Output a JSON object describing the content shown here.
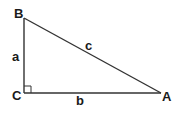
{
  "diagram": {
    "type": "right-triangle",
    "vertices": [
      {
        "id": "B",
        "label": "B",
        "x": 24,
        "y": 18
      },
      {
        "id": "C",
        "label": "C",
        "x": 24,
        "y": 93
      },
      {
        "id": "A",
        "label": "A",
        "x": 161,
        "y": 93
      }
    ],
    "sides": [
      {
        "id": "a",
        "label": "a",
        "from": "C",
        "to": "B"
      },
      {
        "id": "b",
        "label": "b",
        "from": "C",
        "to": "A"
      },
      {
        "id": "c",
        "label": "c",
        "from": "B",
        "to": "A"
      }
    ],
    "right_angle_at": "C",
    "colors": {
      "line": "#333333",
      "text": "#1a1a1a",
      "background": "#ffffff"
    }
  }
}
